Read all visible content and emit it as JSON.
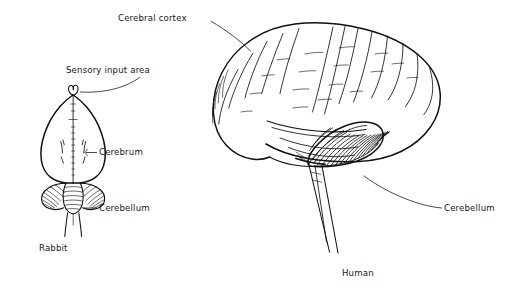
{
  "figure": {
    "title_present": false,
    "background_color": "#ffffff",
    "ink_color": "#101012",
    "specimens": [
      {
        "name": "rabbit-brain",
        "view": "dorsal",
        "caption": "Rabbit",
        "caption_position": {
          "x": 39,
          "y": 251
        }
      },
      {
        "name": "human-brain",
        "view": "lateral",
        "caption": "Human",
        "caption_position": {
          "x": 342,
          "y": 276
        }
      }
    ],
    "labels": [
      {
        "id": "cerebral-cortex",
        "text": "Cerebral cortex",
        "text_x": 118,
        "text_y": 21,
        "target": "human-cerebrum"
      },
      {
        "id": "sensory-input-area",
        "text": "Sensory input area",
        "text_x": 66,
        "text_y": 73,
        "target": "rabbit-olfactory-apex"
      },
      {
        "id": "rabbit-cerebrum",
        "text": "Cerebrum",
        "text_x": 99,
        "text_y": 155,
        "target": "rabbit-cerebrum-edge"
      },
      {
        "id": "rabbit-cerebellum",
        "text": "Cerebellum",
        "text_x": 99,
        "text_y": 211,
        "target": "rabbit-cerebellum-edge"
      },
      {
        "id": "human-cerebellum",
        "text": "Cerebellum",
        "text_x": 444,
        "text_y": 211,
        "target": "human-cerebellum-edge"
      }
    ]
  }
}
